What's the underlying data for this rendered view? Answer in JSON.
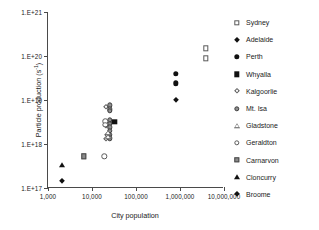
{
  "chart_data": {
    "type": "scatter",
    "title": "",
    "xlabel": "City population",
    "ylabel": "Particle production (s-1)",
    "ylabel_base": "Particle production (s",
    "ylabel_exp": "-1",
    "ylabel_tail": ")",
    "xscale": "log",
    "yscale": "log",
    "xlim": [
      1000,
      10000000
    ],
    "ylim": [
      1e+17,
      1e+21
    ],
    "grid": false,
    "legend_position": "right",
    "xticklabels": [
      "1,000",
      "10,000",
      "100,000",
      "1,000,000",
      "10,000,000"
    ],
    "xtickvalues": [
      1000,
      10000,
      100000,
      1000000,
      10000000
    ],
    "yticklabels": [
      "1.E+17",
      "1.E+18",
      "1.E+19",
      "1.E+20",
      "1.E+21"
    ],
    "ytickvalues": [
      1e+17,
      1e+18,
      1e+19,
      1e+20,
      1e+21
    ],
    "series": [
      {
        "name": "Sydney",
        "marker": "open-square",
        "points": [
          {
            "x": 3900000,
            "y": 1.5e+20
          },
          {
            "x": 3900000,
            "y": 8.8e+19
          }
        ]
      },
      {
        "name": "Adelaide",
        "marker": "filled-diamond",
        "points": [
          {
            "x": 820000,
            "y": 1e+19
          }
        ]
      },
      {
        "name": "Perth",
        "marker": "filled-circle",
        "points": [
          {
            "x": 800000,
            "y": 3.9e+19
          },
          {
            "x": 800000,
            "y": 2.4e+19
          }
        ]
      },
      {
        "name": "Whyalla",
        "marker": "filled-square",
        "points": [
          {
            "x": 32000,
            "y": 3.2e+18
          }
        ]
      },
      {
        "name": "Kalgoorlie",
        "marker": "open-diamond",
        "points": [
          {
            "x": 21000,
            "y": 7e+18
          },
          {
            "x": 21000,
            "y": 2.5e+18
          },
          {
            "x": 21000,
            "y": 1.3e+18
          },
          {
            "x": 22000,
            "y": 1.6e+18
          }
        ]
      },
      {
        "name": "Mt. Isa",
        "marker": "gray-circle",
        "points": [
          {
            "x": 25000,
            "y": 7.6e+18
          },
          {
            "x": 25000,
            "y": 6.1e+18
          },
          {
            "x": 25000,
            "y": 5.6e+18
          },
          {
            "x": 25000,
            "y": 3.6e+18
          },
          {
            "x": 25000,
            "y": 2.9e+18
          },
          {
            "x": 25000,
            "y": 2.4e+18
          },
          {
            "x": 25000,
            "y": 2e+18
          },
          {
            "x": 25000,
            "y": 1.6e+18
          },
          {
            "x": 25000,
            "y": 1.35e+18
          }
        ]
      },
      {
        "name": "Gladstone",
        "marker": "open-triangle",
        "points": [
          {
            "x": 23000,
            "y": 1.75e+18
          },
          {
            "x": 23000,
            "y": 1.45e+18
          }
        ]
      },
      {
        "name": "Geraldton",
        "marker": "open-circle",
        "points": [
          {
            "x": 20000,
            "y": 3.3e+18
          },
          {
            "x": 20000,
            "y": 2.7e+18
          },
          {
            "x": 19000,
            "y": 5.2e+17
          }
        ]
      },
      {
        "name": "Carnarvon",
        "marker": "gray-square",
        "points": [
          {
            "x": 6500,
            "y": 5.2e+17
          }
        ]
      },
      {
        "name": "Cloncurry",
        "marker": "filled-triangle",
        "points": [
          {
            "x": 2050,
            "y": 3.3e+17
          }
        ]
      },
      {
        "name": "Broome",
        "marker": "filled-diamond",
        "points": [
          {
            "x": 2050,
            "y": 1.45e+17
          }
        ]
      }
    ]
  }
}
